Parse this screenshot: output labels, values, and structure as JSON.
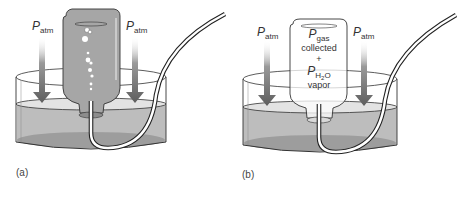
{
  "figure": {
    "panels": [
      {
        "id": "a",
        "tag": "(a)",
        "labels": {
          "left_pressure": {
            "symbol": "P",
            "subscript": "atm"
          },
          "right_pressure": {
            "symbol": "P",
            "subscript": "atm"
          }
        },
        "bottle_state": "filled with water, gas bubbles rising"
      },
      {
        "id": "b",
        "tag": "(b)",
        "labels": {
          "left_pressure": {
            "symbol": "P",
            "subscript": "atm"
          },
          "right_pressure": {
            "symbol": "P",
            "subscript": "atm"
          },
          "bottle_text": {
            "gas_symbol": "P",
            "gas_subscript": "gas",
            "gas_line2": "collected",
            "plus": "+",
            "vapor_symbol": "P",
            "vapor_subscript_h": "H",
            "vapor_subscript_2": "2",
            "vapor_subscript_o": "O",
            "vapor_line2": "vapor"
          }
        },
        "bottle_state": "filled with gas"
      }
    ],
    "colors": {
      "water": "#b9b9b9",
      "water_deep": "#9a9a9a",
      "surface": "#e4e4e4",
      "bottle_water": "#a3a3a3",
      "arrow": "#6e6e6e",
      "outline": "#333333"
    }
  }
}
